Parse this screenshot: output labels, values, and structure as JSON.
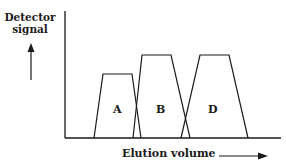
{
  "diagram": {
    "type": "chromatogram",
    "y_axis_label_line1": "Detector",
    "y_axis_label_line2": "signal",
    "x_axis_label": "Elution volume",
    "peaks": [
      {
        "label": "A",
        "relative_height": "low"
      },
      {
        "label": "B",
        "relative_height": "high"
      },
      {
        "label": "D",
        "relative_height": "high"
      }
    ],
    "colors": {
      "line": "#1a1a1a",
      "background": "#ffffff"
    }
  }
}
